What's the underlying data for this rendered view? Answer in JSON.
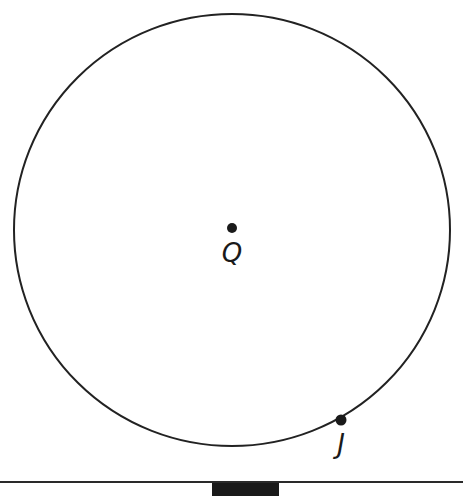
{
  "diagram": {
    "type": "circle-geometry",
    "circle": {
      "cx": 232,
      "cy": 230,
      "rx": 218,
      "ry": 216,
      "stroke": "#222222",
      "stroke_width": 2
    },
    "points": [
      {
        "id": "center",
        "label": "Q",
        "x": 232,
        "y": 228,
        "label_x": 232,
        "label_y": 240
      },
      {
        "id": "on_circle",
        "label": "J",
        "x": 341,
        "y": 420,
        "label_x": 341,
        "label_y": 431
      }
    ],
    "colors": {
      "ink": "#1a1a1a",
      "background": "#ffffff"
    }
  }
}
